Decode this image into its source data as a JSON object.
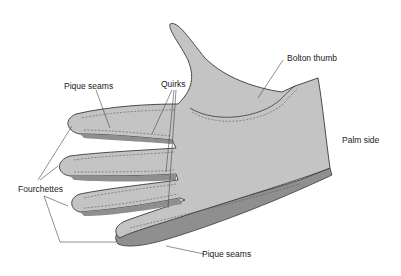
{
  "figure": {
    "colors": {
      "glove_fill": "#c4c4c4",
      "glove_outline": "#3a3a3a",
      "seam": "#5a5a5a",
      "leader_line": "#444444",
      "shadow_edge": "#8a8a8a",
      "background": "#ffffff"
    },
    "labels": {
      "pique_seams_top": "Pique seams",
      "quirks": "Quirks",
      "bolton_thumb": "Bolton thumb",
      "palm_side": "Palm side",
      "fourchettes": "Fourchettes",
      "pique_seams_bottom": "Pique seams"
    }
  }
}
